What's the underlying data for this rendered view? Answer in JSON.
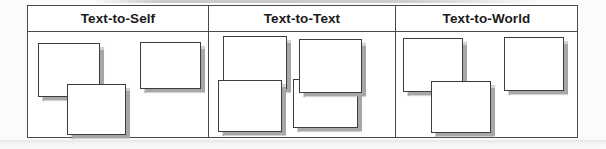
{
  "page": {
    "background": "#fbfbfb"
  },
  "organizer": {
    "columns": [
      {
        "label": "Text-to-Self",
        "notes": [
          {
            "x": 10,
            "y": 37,
            "w": 62,
            "h": 54,
            "z": 1
          },
          {
            "x": 112,
            "y": 36,
            "w": 61,
            "h": 47,
            "z": 1
          },
          {
            "x": 39,
            "y": 78,
            "w": 59,
            "h": 51,
            "z": 2
          }
        ]
      },
      {
        "label": "Text-to-Text",
        "notes": [
          {
            "x": 195,
            "y": 30,
            "w": 64,
            "h": 53,
            "z": 1
          },
          {
            "x": 271,
            "y": 33,
            "w": 63,
            "h": 54,
            "z": 3
          },
          {
            "x": 190,
            "y": 74,
            "w": 64,
            "h": 52,
            "z": 2
          },
          {
            "x": 265,
            "y": 73,
            "w": 65,
            "h": 49,
            "z": 1
          }
        ]
      },
      {
        "label": "Text-to-World",
        "notes": [
          {
            "x": 375,
            "y": 32,
            "w": 60,
            "h": 54,
            "z": 1
          },
          {
            "x": 476,
            "y": 31,
            "w": 60,
            "h": 54,
            "z": 1
          },
          {
            "x": 403,
            "y": 75,
            "w": 60,
            "h": 52,
            "z": 2
          }
        ]
      }
    ],
    "colors": {
      "table_border": "#4a4a4a",
      "header_text": "#1b1b1b",
      "note_border": "#3d3d3d",
      "note_fill": "#ffffff",
      "note_shadow": "#a7a7a7"
    }
  }
}
